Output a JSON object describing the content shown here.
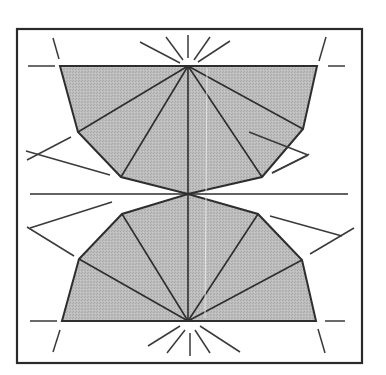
{
  "diagram": {
    "width": 386,
    "height": 375,
    "colors": {
      "background": "#ffffff",
      "fill": "#b9b9b9",
      "stroke": "#2e2e2e",
      "frame": "#2a2a2a",
      "artifact": "#e6e6e6"
    },
    "frame": {
      "x": 17,
      "y": 29,
      "w": 345,
      "h": 334
    },
    "top_shape": {
      "polygon": [
        [
          60,
          66
        ],
        [
          317,
          66
        ],
        [
          303,
          129
        ],
        [
          262,
          177
        ],
        [
          188,
          194
        ],
        [
          121,
          177
        ],
        [
          78,
          132
        ]
      ],
      "apex": [
        188,
        66
      ],
      "fan_targets": [
        [
          78,
          132
        ],
        [
          121,
          177
        ],
        [
          188,
          194
        ],
        [
          262,
          177
        ],
        [
          303,
          129
        ]
      ]
    },
    "bottom_shape": {
      "polygon": [
        [
          62,
          321
        ],
        [
          316,
          321
        ],
        [
          302,
          260
        ],
        [
          258,
          214
        ],
        [
          188,
          194
        ],
        [
          122,
          214
        ],
        [
          79,
          259
        ]
      ],
      "apex": [
        188,
        321
      ],
      "fan_targets": [
        [
          79,
          259
        ],
        [
          122,
          214
        ],
        [
          188,
          194
        ],
        [
          258,
          214
        ],
        [
          302,
          260
        ]
      ]
    },
    "center_axis": {
      "horizontal": [
        [
          30,
          194
        ],
        [
          348,
          194
        ]
      ],
      "vertical": [
        [
          188,
          66
        ],
        [
          188,
          321
        ]
      ]
    },
    "artifact_line": [
      [
        207,
        68
      ],
      [
        205,
        318
      ]
    ],
    "guide_lines": [
      [
        [
          28,
          66
        ],
        [
          55,
          66
        ]
      ],
      [
        [
          53,
          38
        ],
        [
          59,
          59
        ]
      ],
      [
        [
          328,
          66
        ],
        [
          345,
          66
        ]
      ],
      [
        [
          326,
          37
        ],
        [
          320,
          61
        ]
      ],
      [
        [
          27,
          161
        ],
        [
          71,
          137
        ]
      ],
      [
        [
          26,
          152
        ],
        [
          110,
          175
        ]
      ],
      [
        [
          308,
          155
        ],
        [
          272,
          173
        ]
      ],
      [
        [
          308,
          155
        ],
        [
          308,
          155
        ]
      ],
      [
        [
          309,
          154
        ],
        [
          310,
          154
        ]
      ],
      [
        [
          308,
          155
        ],
        [
          309,
          154
        ]
      ],
      [
        [
          308,
          155
        ],
        [
          308,
          155
        ]
      ],
      [
        [
          308,
          155
        ],
        [
          308,
          155
        ]
      ],
      [
        [
          308,
          155
        ],
        [
          308,
          155
        ]
      ],
      [
        [
          308,
          155
        ],
        [
          308,
          155
        ]
      ],
      [
        [
          308,
          155
        ],
        [
          308,
          155
        ]
      ],
      [
        [
          308,
          155
        ],
        [
          308,
          155
        ]
      ],
      [
        [
          308,
          155
        ],
        [
          308,
          155
        ]
      ],
      [
        [
          308,
          155
        ],
        [
          308,
          155
        ]
      ],
      [
        [
          308,
          155
        ],
        [
          308,
          155
        ]
      ],
      [
        [
          308,
          155
        ],
        [
          308,
          155
        ]
      ],
      [
        [
          308,
          155
        ],
        [
          308,
          155
        ]
      ],
      [
        [
          308,
          155
        ],
        [
          308,
          155
        ]
      ],
      [
        [
          308,
          155
        ],
        [
          308,
          155
        ]
      ],
      [
        [
          308,
          155
        ],
        [
          308,
          155
        ]
      ],
      [
        [
          308,
          155
        ],
        [
          308,
          155
        ]
      ],
      [
        [
          308,
          155
        ],
        [
          308,
          155
        ]
      ],
      [
        [
          308,
          155
        ],
        [
          308,
          155
        ]
      ],
      [
        [
          308,
          155
        ],
        [
          308,
          155
        ]
      ],
      [
        [
          308,
          155
        ],
        [
          308,
          155
        ]
      ],
      [
        [
          308,
          155
        ],
        [
          308,
          155
        ]
      ],
      [
        [
          308,
          155
        ],
        [
          308,
          155
        ]
      ],
      [
        [
          308,
          155
        ],
        [
          308,
          155
        ]
      ],
      [
        [
          308,
          155
        ],
        [
          308,
          155
        ]
      ],
      [
        [
          308,
          155
        ],
        [
          308,
          155
        ]
      ],
      [
        [
          308,
          155
        ],
        [
          308,
          155
        ]
      ],
      [
        [
          308,
          155
        ],
        [
          308,
          155
        ]
      ],
      [
        [
          308,
          155
        ],
        [
          308,
          155
        ]
      ],
      [
        [
          308,
          155
        ],
        [
          308,
          155
        ]
      ],
      [
        [
          308,
          155
        ],
        [
          308,
          155
        ]
      ],
      [
        [
          308,
          155
        ],
        [
          308,
          155
        ]
      ],
      [
        [
          308,
          155
        ],
        [
          308,
          155
        ]
      ],
      [
        [
          308,
          155
        ],
        [
          308,
          155
        ]
      ],
      [
        [
          308,
          155
        ],
        [
          308,
          155
        ]
      ],
      [
        [
          308,
          155
        ],
        [
          308,
          155
        ]
      ],
      [
        [
          308,
          155
        ],
        [
          308,
          155
        ]
      ],
      [
        [
          308,
          155
        ],
        [
          308,
          155
        ]
      ],
      [
        [
          308,
          155
        ],
        [
          308,
          155
        ]
      ],
      [
        [
          308,
          155
        ],
        [
          308,
          155
        ]
      ],
      [
        [
          308,
          155
        ],
        [
          308,
          155
        ]
      ],
      [
        [
          308,
          155
        ],
        [
          308,
          155
        ]
      ],
      [
        [
          308,
          155
        ],
        [
          308,
          155
        ]
      ],
      [
        [
          308,
          155
        ],
        [
          308,
          155
        ]
      ],
      [
        [
          308,
          155
        ],
        [
          308,
          155
        ]
      ],
      [
        [
          308,
          155
        ],
        [
          308,
          155
        ]
      ],
      [
        [
          308,
          155
        ],
        [
          308,
          155
        ]
      ],
      [
        [
          308,
          155
        ],
        [
          308,
          155
        ]
      ],
      [
        [
          308,
          155
        ],
        [
          308,
          155
        ]
      ],
      [
        [
          308,
          155
        ],
        [
          308,
          155
        ]
      ],
      [
        [
          308,
          155
        ],
        [
          308,
          155
        ]
      ],
      [
        [
          308,
          155
        ],
        [
          308,
          155
        ]
      ],
      [
        [
          308,
          155
        ],
        [
          308,
          155
        ]
      ]
    ]
  }
}
